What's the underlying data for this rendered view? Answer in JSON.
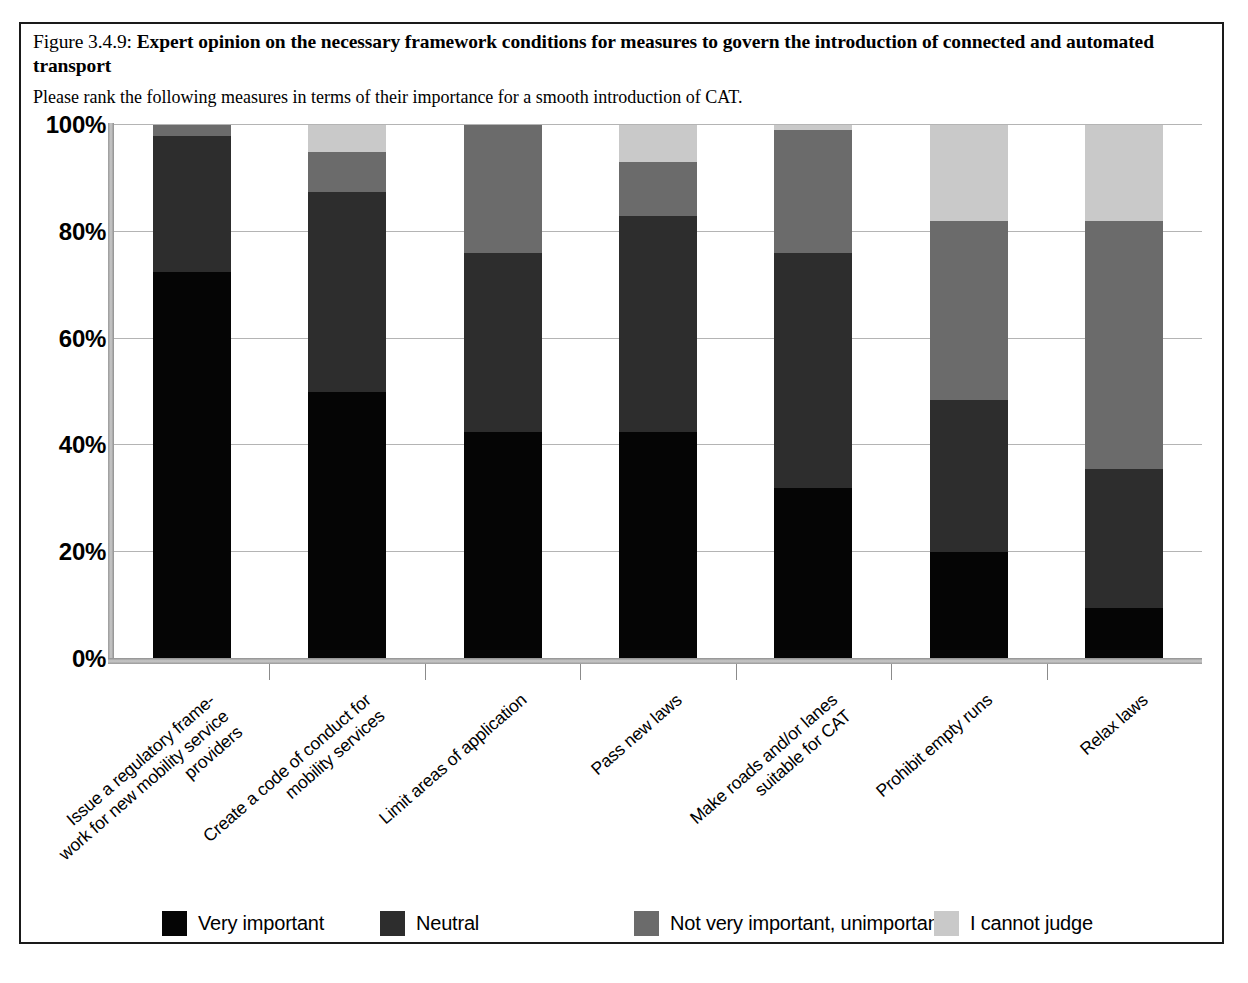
{
  "figure": {
    "number": "Figure 3.4.9:",
    "title": "Expert opinion on the necessary framework conditions for measures to govern the introduction of connected and automated transport",
    "subtitle": "Please rank the following measures in terms of their importance for a smooth introduction of CAT."
  },
  "chart_data": {
    "type": "bar",
    "stacked": true,
    "stack_mode": "percent",
    "title": "Expert opinion on the necessary framework conditions for measures to govern the introduction of connected and automated transport",
    "subtitle": "Please rank the following measures in terms of their importance for a smooth introduction of CAT.",
    "xlabel": "",
    "ylabel": "",
    "ylim": [
      0,
      100
    ],
    "yticks": [
      "0%",
      "20%",
      "40%",
      "60%",
      "80%",
      "100%"
    ],
    "ytick_values": [
      0,
      20,
      40,
      60,
      80,
      100
    ],
    "grid": true,
    "legend_position": "bottom",
    "categories": [
      "Issue a regulatory frame-\nwork for new mobility service\nproviders",
      "Create a code of conduct for\nmobility services",
      "Limit areas of application",
      "Pass new laws",
      "Make roads and/or lanes\nsuitable for CAT",
      "Prohibit empty runs",
      "Relax laws"
    ],
    "categories_flat": [
      "Issue a regulatory framework for new mobility service providers",
      "Create a code of conduct for mobility services",
      "Limit areas of application",
      "Pass new laws",
      "Make roads and/or lanes suitable for CAT",
      "Prohibit empty runs",
      "Relax laws"
    ],
    "series": [
      {
        "name": "Very important",
        "color": "#050505",
        "values": [
          72.5,
          50.0,
          42.5,
          42.5,
          32.0,
          20.0,
          9.5
        ]
      },
      {
        "name": "Neutral",
        "color": "#2d2d2d",
        "values": [
          25.5,
          37.5,
          33.5,
          40.5,
          44.0,
          28.5,
          26.0
        ]
      },
      {
        "name": "Not very important, unimportant",
        "color": "#6b6b6b",
        "values": [
          2.0,
          7.5,
          24.0,
          10.0,
          23.0,
          33.5,
          46.5
        ]
      },
      {
        "name": "I cannot judge",
        "color": "#c9c9c9",
        "values": [
          0.0,
          5.0,
          0.0,
          7.0,
          1.0,
          18.0,
          18.0
        ]
      }
    ]
  },
  "legend": {
    "items": [
      {
        "label": "Very important",
        "color": "#050505"
      },
      {
        "label": "Neutral",
        "color": "#2d2d2d"
      },
      {
        "label": "Not very important, unimportant",
        "color": "#6b6b6b"
      },
      {
        "label": "I cannot judge",
        "color": "#c9c9c9"
      }
    ]
  }
}
